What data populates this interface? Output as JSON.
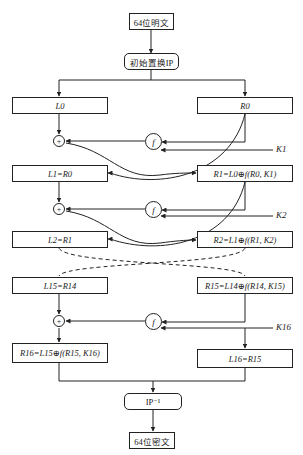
{
  "diagram": {
    "input": "64位明文",
    "initial_perm": "初始置换IP",
    "rows": [
      {
        "left": "L0",
        "right": "R0"
      },
      {
        "left": "L1=R0",
        "right": "R1=L0⊕f(R0, K1)"
      },
      {
        "left": "L2=R1",
        "right": "R2=L1⊕f(R1, K2)"
      },
      {
        "left": "L15=R14",
        "right": "R15=L14⊕f(R14, K15)"
      },
      {
        "left": "R16=L15⊕f(R15, K16)",
        "right": "L16=R15"
      }
    ],
    "keys": [
      "K1",
      "K2",
      "K16"
    ],
    "f_label": "f",
    "xor_symbol": "+",
    "final_perm": "IP⁻¹",
    "output": "64位密文"
  }
}
